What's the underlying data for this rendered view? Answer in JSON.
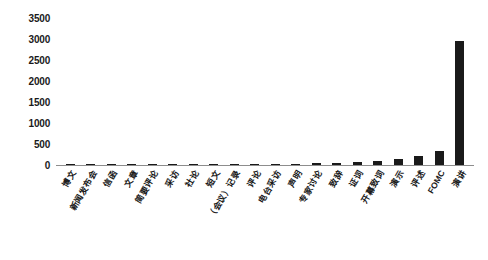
{
  "chart_data": {
    "type": "bar",
    "title": "",
    "xlabel": "",
    "ylabel": "",
    "ylim": [
      0,
      3500
    ],
    "ytick_values": [
      3500,
      3000,
      2500,
      2000,
      1500,
      1000,
      500,
      0
    ],
    "ytick_labels": [
      "3500",
      "3000",
      "2500",
      "2000",
      "1500",
      "1000",
      "500",
      "0"
    ],
    "grid": false,
    "legend": false,
    "bar_color": "#1a1a1a",
    "axis_color": "#8d8d8d",
    "categories": [
      "博文",
      "新闻发布会",
      "信函",
      "文章",
      "简要评论",
      "采访",
      "社论",
      "短文",
      "（会议）记录",
      "评论",
      "电台采访",
      "声明",
      "专家讨论",
      "致辞",
      "证词",
      "开幕致词",
      "演示",
      "评述",
      "FOMC",
      "演讲"
    ],
    "values": [
      4,
      5,
      6,
      7,
      9,
      10,
      12,
      14,
      16,
      20,
      24,
      30,
      38,
      48,
      62,
      95,
      150,
      205,
      330,
      2950
    ]
  }
}
